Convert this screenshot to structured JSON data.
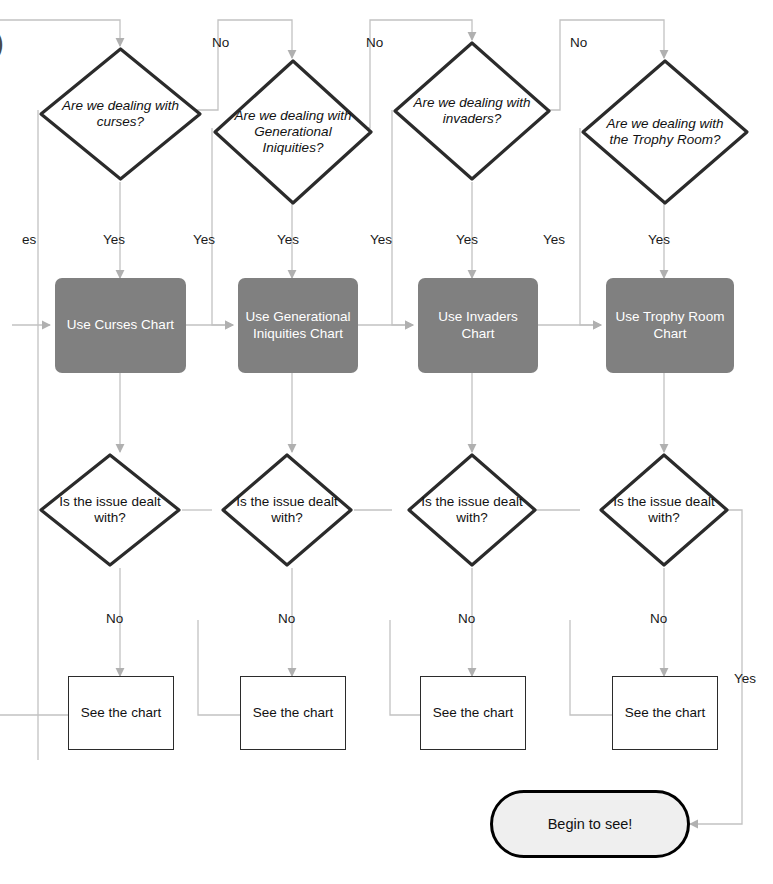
{
  "diagram": {
    "type": "flowchart",
    "canvas": {
      "width": 773,
      "height": 884
    },
    "colors": {
      "process_fill": "#808080",
      "process_text": "#ffffff",
      "node_stroke": "#2b2b2b",
      "connector": "#b9b9b9",
      "terminator_fill": "#efefef",
      "terminator_stroke": "#000000",
      "background": "#ffffff"
    },
    "decisions": [
      {
        "id": "d1",
        "label": "Are we dealing with curses?"
      },
      {
        "id": "d2",
        "label": "Are we dealing with Generational Iniquities?"
      },
      {
        "id": "d3",
        "label": "Are we dealing with invaders?"
      },
      {
        "id": "d4",
        "label": "Are we dealing with the Trophy Room?"
      }
    ],
    "processes": [
      {
        "id": "p1",
        "label": "Use Curses Chart"
      },
      {
        "id": "p2",
        "label": "Use Generational Iniquities Chart"
      },
      {
        "id": "p3",
        "label": "Use Invaders Chart"
      },
      {
        "id": "p4",
        "label": "Use Trophy Room Chart"
      }
    ],
    "checks": [
      {
        "id": "c1",
        "label": "Is the issue dealt with?"
      },
      {
        "id": "c2",
        "label": "Is the issue dealt with?"
      },
      {
        "id": "c3",
        "label": "Is the issue dealt with?"
      },
      {
        "id": "c4",
        "label": "Is the issue dealt with?"
      }
    ],
    "outcomes": [
      {
        "id": "o1",
        "label": "See the chart"
      },
      {
        "id": "o2",
        "label": "See the chart"
      },
      {
        "id": "o3",
        "label": "See the chart"
      },
      {
        "id": "o4",
        "label": "See the chart"
      }
    ],
    "terminator": {
      "id": "t1",
      "label": "Begin to see!"
    },
    "edge_labels": {
      "no_top": [
        "No",
        "No",
        "No"
      ],
      "yes_left_clipped": "es",
      "yes_row": [
        "Yes",
        "Yes",
        "Yes",
        "Yes",
        "Yes",
        "Yes",
        "Yes"
      ],
      "no_row": [
        "No",
        "No",
        "No",
        "No"
      ],
      "yes_final": "Yes"
    },
    "clipped_glyph": ")"
  }
}
